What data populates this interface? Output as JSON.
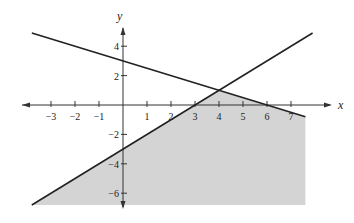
{
  "chart_data": {
    "type": "line",
    "title": "",
    "xlabel": "x",
    "ylabel": "y",
    "xlim": [
      -3.8,
      7.9
    ],
    "ylim": [
      -7,
      5
    ],
    "grid": false,
    "x_ticks": [
      -3,
      -2,
      -1,
      1,
      2,
      3,
      4,
      5,
      6,
      7
    ],
    "x_tick_labels": [
      "−3",
      "−2",
      "−1",
      "1",
      "2",
      "3",
      "4",
      "5",
      "6",
      "7"
    ],
    "y_ticks": [
      4,
      2,
      -2,
      -4,
      -6
    ],
    "y_tick_labels": [
      "4",
      "2",
      "−2",
      "−4",
      "−6"
    ],
    "series": [
      {
        "name": "y = -x/2 + 3",
        "x": [
          -3.8,
          7.6
        ],
        "y": [
          4.9,
          -0.8
        ]
      },
      {
        "name": "y = x - 3",
        "x": [
          -3.8,
          7.9
        ],
        "y": [
          -6.8,
          4.9
        ]
      }
    ],
    "shaded_region": {
      "description": "Region below both lines (feasible region)",
      "vertices": [
        [
          -3.8,
          -6.8
        ],
        [
          4,
          1
        ],
        [
          7.6,
          -0.8
        ],
        [
          7.6,
          -6.8
        ]
      ],
      "color": "#d4d4d4"
    },
    "intersection": [
      4,
      1
    ]
  },
  "colors": {
    "line": "#222222",
    "shade": "#d4d4d4",
    "axis": "#333333"
  }
}
